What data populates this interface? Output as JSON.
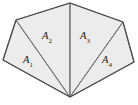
{
  "figure": {
    "background_color": "#ffffff",
    "face_fill_color": "#ececec",
    "inner_edge_color": "#6f6f6f",
    "outer_edge_color": "#4a4a4a",
    "label_color": "#1a1a1a",
    "outline_points": "70,3 123,22 134,62 70,97 3,60 16,20",
    "vertices": [
      {
        "name": "top-apex",
        "x": 70,
        "y": 3
      },
      {
        "name": "upper-right",
        "x": 123,
        "y": 22
      },
      {
        "name": "right",
        "x": 134,
        "y": 62
      },
      {
        "name": "bottom-apex",
        "x": 70,
        "y": 97
      },
      {
        "name": "left",
        "x": 3,
        "y": 60
      },
      {
        "name": "upper-left",
        "x": 16,
        "y": 20
      }
    ],
    "regions": [
      {
        "id": "A1",
        "label": "A",
        "subscript": "1",
        "points": "70,97 3,60 16,20",
        "label_x": 28,
        "label_y": 63
      },
      {
        "id": "A2",
        "label": "A",
        "subscript": "2",
        "points": "70,97 16,20 70,3",
        "label_x": 47,
        "label_y": 39
      },
      {
        "id": "A3",
        "label": "A",
        "subscript": "3",
        "points": "70,97 70,3 123,22",
        "label_x": 85,
        "label_y": 39
      },
      {
        "id": "A4",
        "label": "A",
        "subscript": "4",
        "points": "70,97 123,22 134,62",
        "label_x": 107,
        "label_y": 63
      }
    ],
    "inner_edges": [
      {
        "name": "apex-to-upper-left",
        "x1": 70,
        "y1": 97,
        "x2": 16,
        "y2": 20
      },
      {
        "name": "apex-to-top",
        "x1": 70,
        "y1": 97,
        "x2": 70,
        "y2": 3
      },
      {
        "name": "apex-to-upper-right",
        "x1": 70,
        "y1": 97,
        "x2": 123,
        "y2": 22
      }
    ]
  }
}
